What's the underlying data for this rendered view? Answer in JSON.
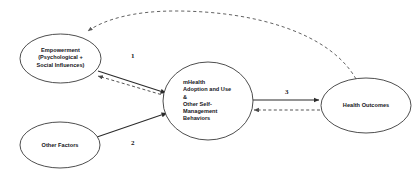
{
  "diagram": {
    "type": "path-diagram",
    "canvas": {
      "width": 419,
      "height": 191,
      "background": "#ffffff"
    },
    "colors": {
      "node_stroke": "#3a3a3a",
      "node_fill": "#ffffff",
      "solid_edge": "#2b2b2b",
      "dashed_edge": "#4a4a4a",
      "text": "#15151a"
    },
    "nodes": [
      {
        "id": "empowerment",
        "label": "Empowerment\n(Psychological +\nSocial Influences)",
        "shape": "ellipse",
        "cx": 60.5,
        "cy": 58.5,
        "rx": 40.5,
        "ry": 24.5
      },
      {
        "id": "other-factors",
        "label": "Other Factors",
        "shape": "ellipse",
        "cx": 60,
        "cy": 145,
        "rx": 40,
        "ry": 23
      },
      {
        "id": "mhealth",
        "label": "mHealth\nAdoption and Use\n&\nOther Self-\nManagement\nBehaviors",
        "shape": "ellipse",
        "cx": 208,
        "cy": 101,
        "rx": 45,
        "ry": 39
      },
      {
        "id": "health-outcomes",
        "label": "Health Outcomes",
        "shape": "ellipse",
        "cx": 366,
        "cy": 105.5,
        "rx": 45,
        "ry": 27.5
      }
    ],
    "edges": [
      {
        "id": "empowerment-to-mhealth",
        "from": "empowerment",
        "to": "mhealth",
        "style": "solid",
        "label": "1",
        "label_x": 131,
        "label_y": 56
      },
      {
        "id": "mhealth-to-empowerment",
        "from": "mhealth",
        "to": "empowerment",
        "style": "dashed",
        "label": ""
      },
      {
        "id": "other-factors-to-mhealth",
        "from": "other-factors",
        "to": "mhealth",
        "style": "solid",
        "label": "2",
        "label_x": 131,
        "label_y": 143
      },
      {
        "id": "mhealth-to-health-outcomes",
        "from": "mhealth",
        "to": "health-outcomes",
        "style": "solid",
        "label": "3",
        "label_x": 285,
        "label_y": 92
      },
      {
        "id": "health-outcomes-to-mhealth",
        "from": "health-outcomes",
        "to": "mhealth",
        "style": "dashed",
        "label": ""
      },
      {
        "id": "health-outcomes-to-empowerment-feedback",
        "from": "health-outcomes",
        "to": "empowerment",
        "style": "dashed-arc",
        "label": ""
      }
    ]
  }
}
